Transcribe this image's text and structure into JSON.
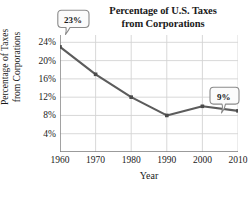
{
  "chart_data": {
    "type": "line",
    "title": "Percentage of U.S. Taxes from Corporations",
    "title_lines": [
      "Percentage of U.S. Taxes",
      "from Corporations"
    ],
    "xlabel": "Year",
    "ylabel": "Percentage of Taxes from Corporations",
    "ylabel_lines": [
      "Percentage of Taxes",
      "from Corporations"
    ],
    "x": [
      1960,
      1970,
      1980,
      1990,
      2000,
      2010
    ],
    "xtick_labels": [
      "1960",
      "1970",
      "1980",
      "1990",
      "2000",
      "2010"
    ],
    "values": [
      23,
      17,
      12,
      8,
      10,
      9
    ],
    "yticks": [
      4,
      8,
      12,
      16,
      20,
      24
    ],
    "ytick_labels": [
      "4%",
      "8%",
      "12%",
      "16%",
      "20%",
      "24%"
    ],
    "xlim": [
      1960,
      2010
    ],
    "ylim": [
      0,
      25.6
    ],
    "grid": true,
    "legend": "none",
    "annotations": [
      {
        "label": "23%",
        "x": 1960,
        "y": 23
      },
      {
        "label": "9%",
        "x": 2010,
        "y": 9
      }
    ],
    "colors": {
      "line": "#5c5c5c",
      "marker": "#4a4a4a",
      "grid": "#d4d4d4",
      "axis": "#7a7a7a",
      "callout_fill": "#fbfbfb",
      "callout_stroke": "#8a8a8a",
      "text": "#1a1a1a"
    }
  }
}
